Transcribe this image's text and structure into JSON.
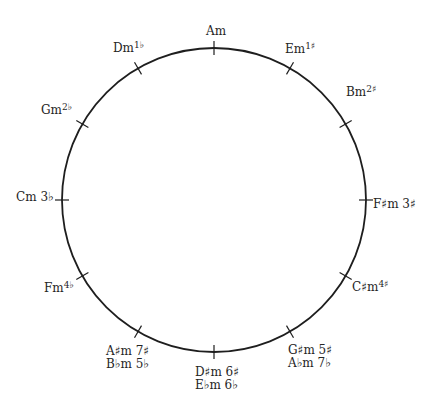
{
  "diagram": {
    "type": "circle-of-fifths-minor-keys",
    "circle": {
      "cx": 214,
      "cy": 200,
      "r": 152,
      "stroke": "#1e1e1e"
    },
    "keys": [
      {
        "id": "am",
        "angle": 0,
        "lines": [
          {
            "name": "Am",
            "sig": ""
          }
        ],
        "x": 206,
        "y": 24,
        "sup": false
      },
      {
        "id": "em",
        "angle": 30,
        "lines": [
          {
            "name": "Em",
            "sig": "1♯"
          }
        ],
        "x": 286,
        "y": 44,
        "sup": true
      },
      {
        "id": "bm",
        "angle": 60,
        "lines": [
          {
            "name": "Bm",
            "sig": "2♯"
          }
        ],
        "x": 345,
        "y": 84,
        "sup": true
      },
      {
        "id": "fsm",
        "angle": 90,
        "lines": [
          {
            "name": "F♯m",
            "sig": "3♯"
          }
        ],
        "x": 375,
        "y": 198,
        "sup": false
      },
      {
        "id": "csm",
        "angle": 120,
        "lines": [
          {
            "name": "C♯m",
            "sig": "4♯"
          }
        ],
        "x": 352,
        "y": 281,
        "sup": true
      },
      {
        "id": "gsm",
        "angle": 150,
        "lines": [
          {
            "name": "G♯m",
            "sig": "5♯"
          },
          {
            "name": "A♭m",
            "sig": "7♭"
          }
        ],
        "x": 288,
        "y": 342,
        "sup": false
      },
      {
        "id": "dsm",
        "angle": 180,
        "lines": [
          {
            "name": "D♯m",
            "sig": "6♯"
          },
          {
            "name": "E♭m",
            "sig": "6♭"
          }
        ],
        "x": 196,
        "y": 364,
        "sup": false
      },
      {
        "id": "asm",
        "angle": 210,
        "lines": [
          {
            "name": "A♯m",
            "sig": "7♯"
          },
          {
            "name": "B♭m",
            "sig": "5♭"
          }
        ],
        "x": 106,
        "y": 345,
        "sup": false
      },
      {
        "id": "fm",
        "angle": 240,
        "lines": [
          {
            "name": "Fm",
            "sig": "4♭"
          }
        ],
        "x": 42,
        "y": 282,
        "sup": true
      },
      {
        "id": "cm",
        "angle": 270,
        "lines": [
          {
            "name": "Cm",
            "sig": "3♭"
          }
        ],
        "x": 17,
        "y": 191,
        "sup": false
      },
      {
        "id": "gm",
        "angle": 300,
        "lines": [
          {
            "name": "Gm",
            "sig": "2♭"
          }
        ],
        "x": 43,
        "y": 102,
        "sup": true
      },
      {
        "id": "dm",
        "angle": 330,
        "lines": [
          {
            "name": "Dm",
            "sig": "1♭"
          }
        ],
        "x": 114,
        "y": 41,
        "sup": true
      }
    ]
  },
  "labels": {
    "am": "Am",
    "em": "Em",
    "em_sig": "1♯",
    "bm": "Bm",
    "bm_sig": "2♯",
    "fsm": "F♯m 3♯",
    "csm": "C♯m",
    "csm_sig": "4♯",
    "gsm_1": "G♯m 5♯",
    "gsm_2": "A♭m 7♭",
    "dsm_1": "D♯m 6♯",
    "dsm_2": "E♭m 6♭",
    "asm_1": "A♯m 7♯",
    "asm_2": "B♭m 5♭",
    "fm": "Fm",
    "fm_sig": "4♭",
    "cm": "Cm 3♭",
    "gm": "Gm",
    "gm_sig": "2♭",
    "dm": "Dm",
    "dm_sig": "1♭"
  }
}
